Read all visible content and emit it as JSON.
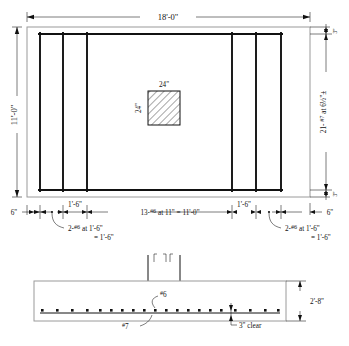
{
  "drawing": {
    "title": "Footing reinforcement plan and section",
    "plan": {
      "name": "footing-plan",
      "top_dimension": "18'-0\"",
      "left_dimension": "11'-0\"",
      "column": {
        "top_label": "24\"",
        "side_label": "24\""
      },
      "right_edge_top": "3\"",
      "right_edge_bottom": "3\"",
      "right_bar_note": "21- #7 at 6½\"±",
      "right_bar_note_parts": {
        "count": "21-",
        "bar": "#7",
        "spacing_text": " at 6",
        "fraction": "½",
        "unit": "\"±"
      }
    },
    "bottom_dimensions": {
      "name": "bottom-dimension-chain",
      "left_end": "6\"",
      "right_end": "6\"",
      "left_group": "1'-6\"",
      "right_group": "1'-6\"",
      "center_span": "13- #6 at 11\" = 11'-0\"",
      "center_span_parts": {
        "count": "13-",
        "bar": "#6",
        "rest": " at 11\" = 11'-0\""
      },
      "left_note_line1": "2- #6 at 1'-6\"",
      "left_note_line2": "= 1'-6\"",
      "right_note_line1": "2- #6 at 1'-6\"",
      "right_note_line2": "= 1'-6\"",
      "note_parts": {
        "count": "2-",
        "bar": "#6",
        "rest": " at 1'-6\""
      }
    },
    "section": {
      "name": "footing-section",
      "depth_label": "2'-8\"",
      "clear_label": "3\" clear",
      "top_bar_label": "#6",
      "bottom_bar_label": "#7",
      "top_bar_parts": {
        "hash": "#",
        "size": "6"
      },
      "bottom_bar_parts": {
        "hash": "#",
        "size": "7"
      }
    },
    "colors": {
      "ink": "#111111",
      "light_line": "#9a9a9a",
      "paper": "#ffffff"
    }
  }
}
